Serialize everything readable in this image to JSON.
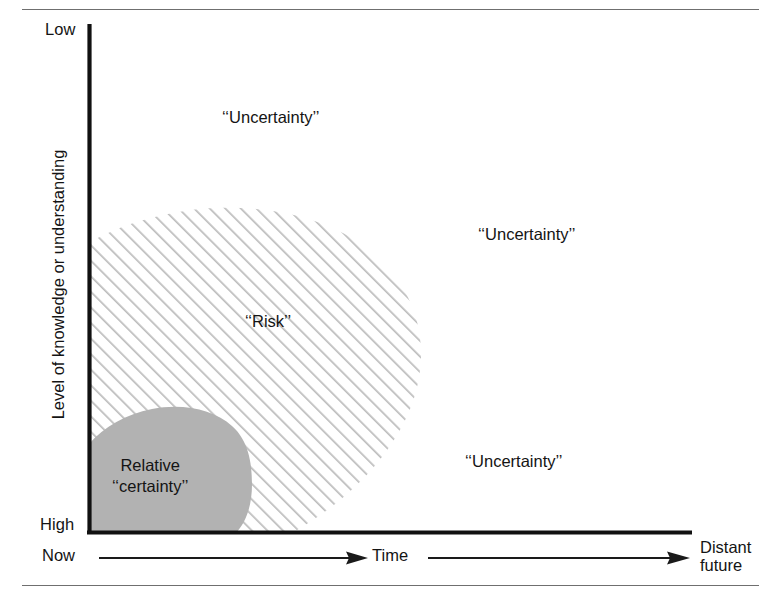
{
  "diagram": {
    "type": "conceptual-region-diagram",
    "y_axis": {
      "title": "Level of knowledge or understanding",
      "top_label": "Low",
      "bottom_label": "High"
    },
    "x_axis": {
      "start_label": "Now",
      "middle_label": "Time",
      "end_label_line1": "Distant",
      "end_label_line2": "future"
    },
    "regions": [
      {
        "name": "uncertainty-top",
        "label": "‘‘Uncertainty’’",
        "fill": "none"
      },
      {
        "name": "uncertainty-right",
        "label": "‘‘Uncertainty’’",
        "fill": "none"
      },
      {
        "name": "uncertainty-bottom-right",
        "label": "‘‘Uncertainty’’",
        "fill": "none"
      },
      {
        "name": "risk",
        "label": "‘‘Risk’’",
        "fill": "diagonal-hatch"
      },
      {
        "name": "relative-certainty",
        "label_line1": "Relative",
        "label_line2": "‘‘certainty’’",
        "fill": "solid-gray"
      }
    ],
    "colors": {
      "gray_fill": "#b2b2b2",
      "hatch_line": "#b9b9b9",
      "axis": "#111111",
      "rule": "#6f6f6f",
      "text": "#141414"
    }
  }
}
